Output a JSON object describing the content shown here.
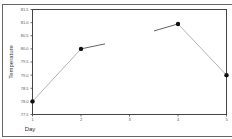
{
  "chart_data": {
    "type": "line",
    "title": "",
    "xlabel": "Day",
    "ylabel": "Temperature",
    "x": [
      1,
      2,
      3,
      4,
      5
    ],
    "x_tick_labels": [
      "1",
      "2",
      "3",
      "4",
      "5"
    ],
    "y_tick_labels": [
      "81.5",
      "81.0",
      "80.5",
      "80.0",
      "79.5",
      "79.0",
      "78.5",
      "78.0",
      "77.5"
    ],
    "ylim": [
      77.5,
      81.5
    ],
    "xlim": [
      1,
      5
    ],
    "series": [
      {
        "name": "Temperature",
        "values": [
          78.0,
          80.0,
          null,
          80.95,
          79.0
        ]
      }
    ],
    "grid": false,
    "legend": null
  }
}
